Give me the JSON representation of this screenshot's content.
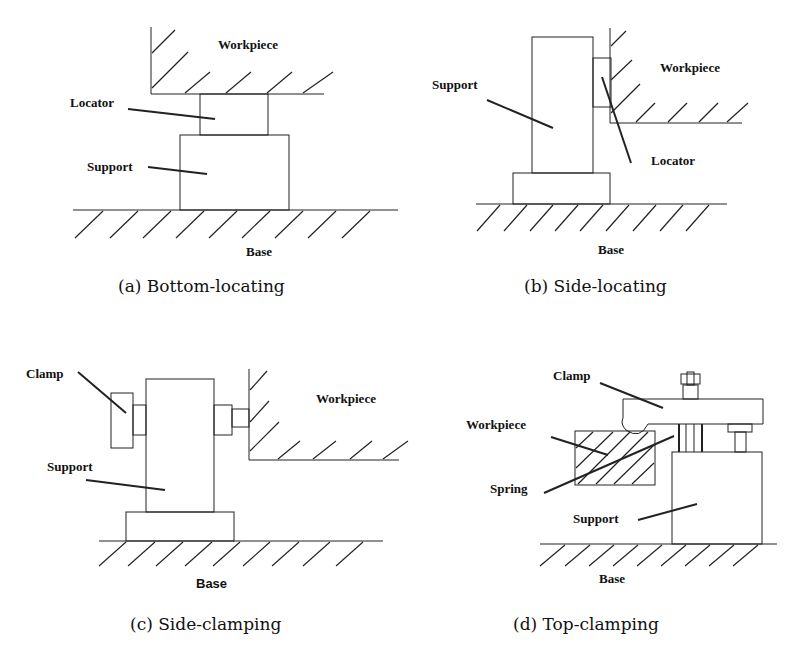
{
  "figure": {
    "panels": [
      {
        "id": "a",
        "caption": "(a) Bottom-locating",
        "labels": {
          "workpiece": "Workpiece",
          "locator": "Locator",
          "support": "Support",
          "base": "Base"
        }
      },
      {
        "id": "b",
        "caption": "(b) Side-locating",
        "labels": {
          "workpiece": "Workpiece",
          "support": "Support",
          "locator": "Locator",
          "base": "Base"
        }
      },
      {
        "id": "c",
        "caption": "(c) Side-clamping",
        "labels": {
          "clamp": "Clamp",
          "workpiece": "Workpiece",
          "support": "Support",
          "base": "Base"
        }
      },
      {
        "id": "d",
        "caption": "(d) Top-clamping",
        "labels": {
          "clamp": "Clamp",
          "workpiece": "Workpiece",
          "spring": "Spring",
          "support": "Support",
          "base": "Base"
        }
      }
    ],
    "line_color": "#222222",
    "background": "#ffffff"
  }
}
